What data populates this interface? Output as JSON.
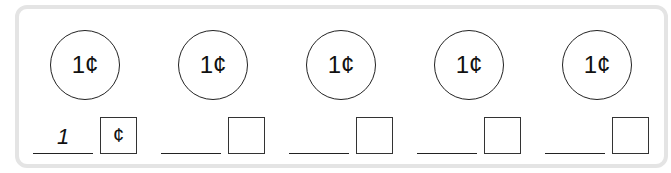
{
  "coins": [
    {
      "label": "1¢",
      "answer": "1",
      "unit": "¢"
    },
    {
      "label": "1¢",
      "answer": "",
      "unit": ""
    },
    {
      "label": "1¢",
      "answer": "",
      "unit": ""
    },
    {
      "label": "1¢",
      "answer": "",
      "unit": ""
    },
    {
      "label": "1¢",
      "answer": "",
      "unit": ""
    }
  ]
}
